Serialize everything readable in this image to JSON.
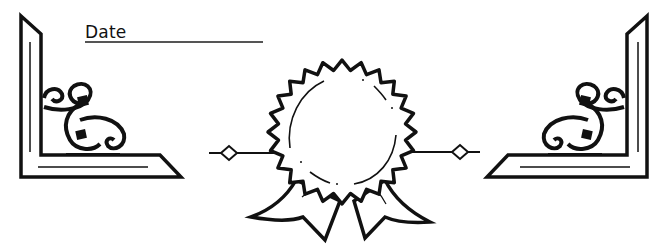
{
  "form": {
    "date_label": "Date",
    "date_value": ""
  },
  "decorations": {
    "left_corner": "ornamental-corner-bracket",
    "right_corner": "ornamental-corner-bracket",
    "center": "award-rosette-ribbon",
    "ink_color": "#111111"
  }
}
